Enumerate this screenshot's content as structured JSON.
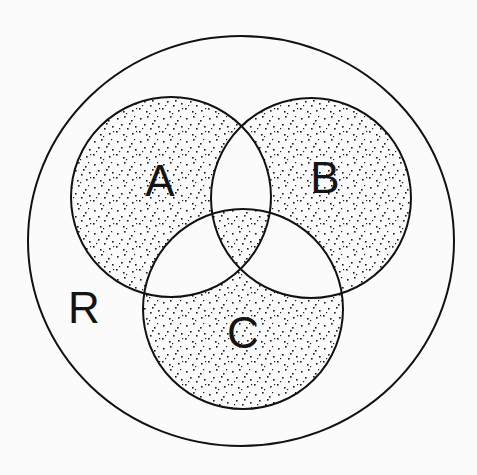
{
  "diagram": {
    "type": "venn",
    "title": "",
    "universe": {
      "label": "R",
      "shape": "ellipse",
      "cx": 241,
      "cy": 241,
      "rx": 213,
      "ry": 205,
      "label_pos": [
        84,
        307
      ]
    },
    "sets": [
      {
        "id": "A",
        "label": "A",
        "cx": 171,
        "cy": 197,
        "r": 100,
        "label_pos": [
          160,
          180
        ]
      },
      {
        "id": "B",
        "label": "B",
        "cx": 311,
        "cy": 198,
        "r": 100,
        "label_pos": [
          325,
          177
        ]
      },
      {
        "id": "C",
        "label": "C",
        "cx": 243,
        "cy": 309,
        "r": 100,
        "label_pos": [
          243,
          332
        ]
      }
    ],
    "shaded_regions": [
      "A only",
      "B only",
      "C only",
      "A∩B∩C"
    ],
    "unshaded_regions": [
      "A∩B only",
      "A∩C only",
      "B∩C only",
      "R outside A∪B∪C"
    ],
    "shading_expression": "A ⊕ B ⊕ C",
    "colors": {
      "line": "#111111",
      "stipple": "#1a1a1a",
      "background": "#fbfbfb"
    }
  }
}
